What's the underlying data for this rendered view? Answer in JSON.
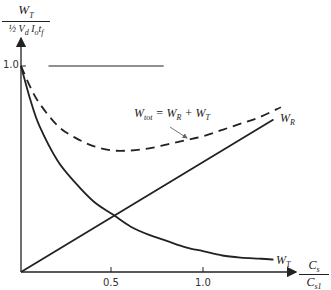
{
  "chart_data": {
    "type": "line",
    "title": "",
    "ylabel": {
      "numerator": "W_T",
      "denominator": "½ V_d I_o t_f"
    },
    "xlabel": {
      "numerator": "C_s",
      "denominator": "C_s1"
    },
    "xticks": [
      "0.5",
      "1.0"
    ],
    "yticks": [
      "1.0"
    ],
    "xlim": [
      0,
      1.55
    ],
    "ylim": [
      0,
      1.25
    ],
    "grid": false,
    "series": [
      {
        "name": "W_T",
        "style": "solid",
        "x": [
          0,
          0.05,
          0.1,
          0.2,
          0.3,
          0.4,
          0.5,
          0.6,
          0.7,
          0.8,
          0.9,
          1.0,
          1.1,
          1.2,
          1.3,
          1.38
        ],
        "y": [
          1.0,
          0.84,
          0.71,
          0.54,
          0.43,
          0.34,
          0.28,
          0.22,
          0.18,
          0.15,
          0.12,
          0.1,
          0.08,
          0.07,
          0.065,
          0.06
        ]
      },
      {
        "name": "W_R",
        "style": "solid",
        "x": [
          0,
          1.38
        ],
        "y": [
          0,
          0.74
        ]
      },
      {
        "name": "W_tot = W_R + W_T",
        "style": "dashed",
        "x": [
          0,
          0.05,
          0.1,
          0.2,
          0.3,
          0.4,
          0.5,
          0.6,
          0.7,
          0.8,
          0.9,
          1.0,
          1.1,
          1.2,
          1.3,
          1.42
        ],
        "y": [
          1.0,
          0.9,
          0.82,
          0.71,
          0.65,
          0.61,
          0.59,
          0.59,
          0.6,
          0.62,
          0.64,
          0.66,
          0.69,
          0.72,
          0.75,
          0.8
        ]
      },
      {
        "name": "reference",
        "style": "solid",
        "x": [
          0.15,
          0.78
        ],
        "y": [
          1.0,
          1.0
        ]
      }
    ],
    "annotations": [
      {
        "text": "W_tot = W_R + W_T",
        "arrow_to_series": "W_tot"
      },
      {
        "text": "W_R",
        "series": "W_R"
      },
      {
        "text": "W_T",
        "series": "W_T"
      }
    ]
  },
  "labels": {
    "y_num": "W",
    "y_num_sub": "T",
    "y_den_frac": "½",
    "y_den": "V",
    "y_den_sub1": "d",
    "y_den_I": "I",
    "y_den_sub2": "o",
    "y_den_t": "t",
    "y_den_sub3": "f",
    "x_num": "C",
    "x_num_sub": "s",
    "x_den": "C",
    "x_den_sub": "s1",
    "ytick_1": "1.0",
    "xtick_05": "0.5",
    "xtick_10": "1.0",
    "ann_wtot": "W",
    "ann_wtot_sub": "tot",
    "ann_wtot_rest": " = W",
    "ann_wtot_sub_r": "R",
    "ann_wtot_plus": " + W",
    "ann_wtot_sub_t": "T",
    "ann_wr": "W",
    "ann_wr_sub": "R",
    "ann_wt": "W",
    "ann_wt_sub": "T"
  }
}
